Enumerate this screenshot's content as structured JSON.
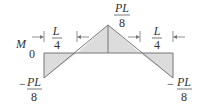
{
  "diagram": {
    "axis_label": "M",
    "zero_label": "0",
    "peak": {
      "numerator": "PL",
      "denominator": "8",
      "sign": ""
    },
    "left_end": {
      "numerator": "PL",
      "denominator": "8",
      "sign": "−"
    },
    "right_end": {
      "numerator": "PL",
      "denominator": "8",
      "sign": "−"
    },
    "left_dim": {
      "numerator": "L",
      "denominator": "4"
    },
    "right_dim": {
      "numerator": "L",
      "denominator": "4"
    },
    "colors": {
      "fill": "#dcdcdc",
      "stroke": "#777777",
      "text": "#333333"
    }
  }
}
